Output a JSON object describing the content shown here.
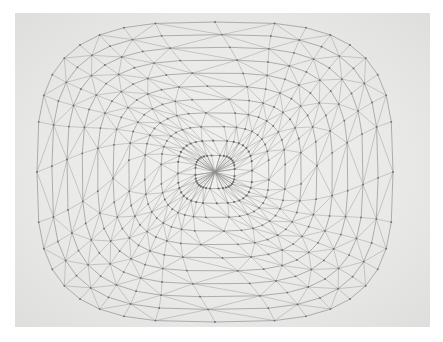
{
  "artwork": {
    "subject": "pencil drawing of a triangulated geodesic grid",
    "canvas": {
      "width": 443,
      "height": 342,
      "background": "#ffffff"
    },
    "paper": {
      "x": 15,
      "y": 13,
      "width": 415,
      "height": 314,
      "color": "#e9e9e8"
    },
    "grid": {
      "center": [
        215,
        172
      ],
      "half_width": 178,
      "half_height": 150,
      "squareness": 3.2,
      "rings": 11,
      "spokes": 36,
      "line_color": "#8f8f8f",
      "node_color": "#6d6d6d",
      "twist": 0.35
    }
  }
}
